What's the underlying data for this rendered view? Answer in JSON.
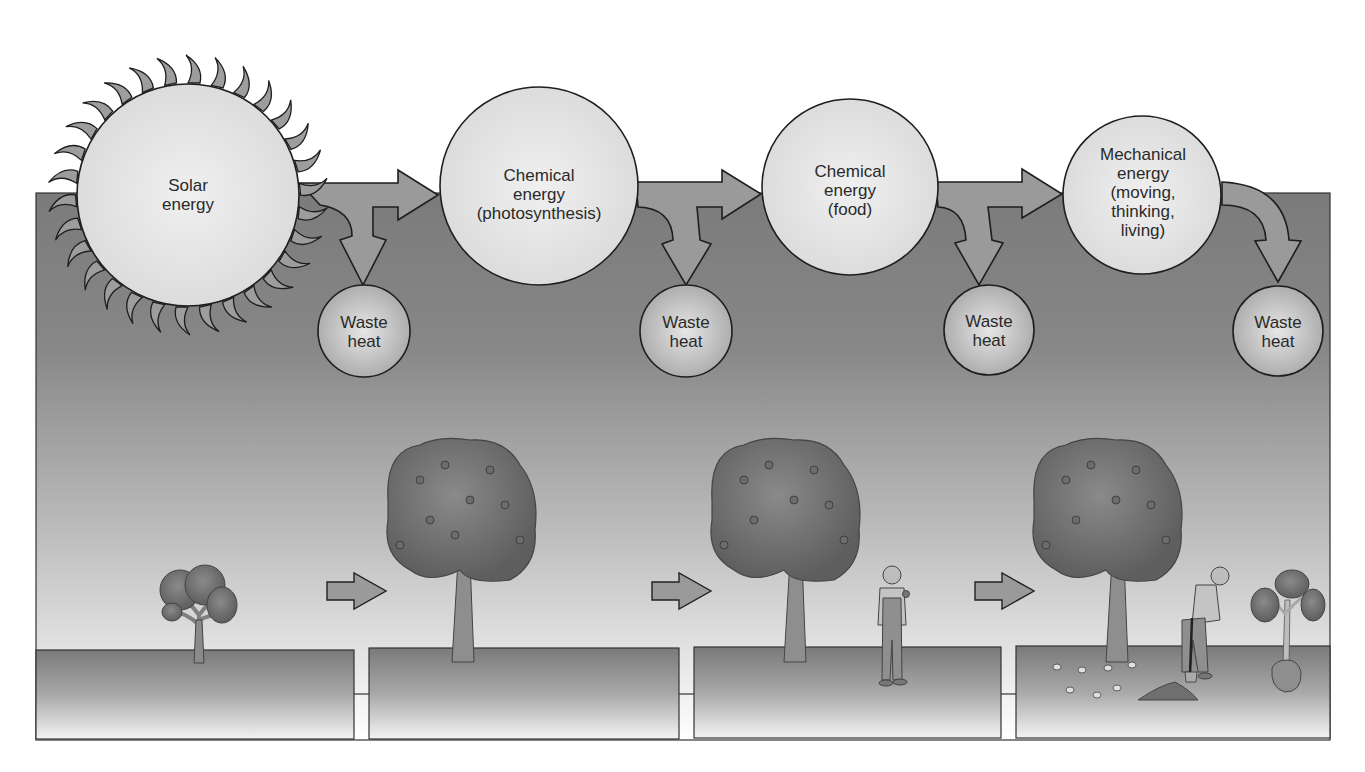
{
  "diagram": {
    "type": "energy-flow",
    "colors": {
      "panel_dark": "#7c7c7c",
      "panel_light": "#ffffff",
      "circle_fill": "#e4e4e4",
      "waste_circle_fill": "#c4c4c4",
      "arrow_fill": "#9a9a9a",
      "outline": "#222222",
      "ground_dark": "#7e7e7e",
      "ground_light": "#f4f4f4"
    },
    "nodes": [
      {
        "id": "solar",
        "lines": [
          "Solar",
          "energy"
        ]
      },
      {
        "id": "photosynthesis",
        "lines": [
          "Chemical",
          "energy",
          "(photosynthesis)"
        ]
      },
      {
        "id": "food",
        "lines": [
          "Chemical",
          "energy",
          "(food)"
        ]
      },
      {
        "id": "mechanical",
        "lines": [
          "Mechanical",
          "energy",
          "(moving,",
          "thinking,",
          "living)"
        ]
      }
    ],
    "waste": [
      {
        "lines": [
          "Waste",
          "heat"
        ]
      },
      {
        "lines": [
          "Waste",
          "heat"
        ]
      },
      {
        "lines": [
          "Waste",
          "heat"
        ]
      },
      {
        "lines": [
          "Waste",
          "heat"
        ]
      }
    ],
    "scenes": [
      {
        "id": "sapling",
        "description": "small tree"
      },
      {
        "id": "fruit-tree",
        "description": "mature tree with fruit"
      },
      {
        "id": "person-eating",
        "description": "tree and man eating fruit"
      },
      {
        "id": "person-planting",
        "description": "tree, apple cores, man digging, new sapling in root ball"
      }
    ]
  }
}
